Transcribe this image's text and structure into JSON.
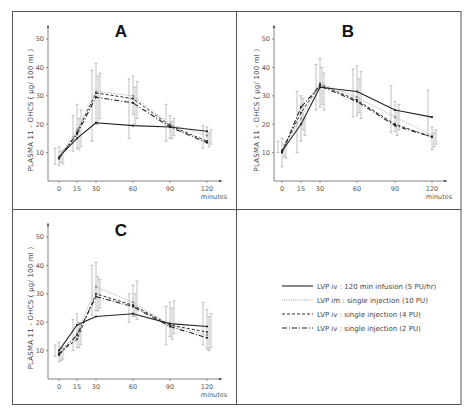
{
  "figure": {
    "legend": [
      {
        "label": "LVP iv : 120 min infusion (5 PU/hr)",
        "style": "solid"
      },
      {
        "label": "LVP im : single injection (10 PU)",
        "style": "dotted"
      },
      {
        "label": "LVP iv : single injection (4 PU)",
        "style": "dashed"
      },
      {
        "label": "LVP iv : single injection (2 PU)",
        "style": "dashdot"
      }
    ]
  },
  "chart_data": [
    {
      "type": "line",
      "title": "A",
      "xlabel": "minutes",
      "ylabel": "PLASMA 11 - OHCS ( µg/ 100 ml )",
      "x": [
        0,
        15,
        30,
        60,
        90,
        120
      ],
      "x_ticks": [
        "0",
        "15",
        "30",
        "60",
        "90",
        "120"
      ],
      "y_ticks": [
        "10",
        "20",
        "30",
        "40",
        "50"
      ],
      "ylim": [
        0,
        52
      ],
      "grid": false,
      "error_bars": true,
      "series": [
        {
          "name": "LVP iv : 120 min infusion (5 PU/hr)",
          "values": [
            8.5,
            15,
            20.5,
            19.5,
            19,
            17.5
          ]
        },
        {
          "name": "LVP im : single injection (10 PU)",
          "values": [
            8.5,
            18,
            31.5,
            30,
            20,
            16
          ]
        },
        {
          "name": "LVP iv : single injection (4 PU)",
          "values": [
            8,
            17,
            31,
            29,
            19.5,
            14
          ]
        },
        {
          "name": "LVP iv : single injection (2 PU)",
          "values": [
            8,
            16.5,
            29.5,
            27.5,
            19,
            13.5
          ]
        }
      ]
    },
    {
      "type": "line",
      "title": "B",
      "xlabel": "minutes",
      "ylabel": "PLASMA 11 - OHCS ( µg/ 100 ml )",
      "x": [
        0,
        15,
        30,
        60,
        90,
        120
      ],
      "x_ticks": [
        "0",
        "15",
        "30",
        "60",
        "90",
        "120"
      ],
      "y_ticks": [
        "10",
        "20",
        "30",
        "40",
        "50"
      ],
      "ylim": [
        0,
        52
      ],
      "grid": false,
      "error_bars": true,
      "series": [
        {
          "name": "LVP iv : 120 min infusion (5 PU/hr)",
          "values": [
            10.5,
            20,
            33,
            31.5,
            25,
            22.5
          ]
        },
        {
          "name": "LVP im : single injection (10 PU)",
          "values": [
            11,
            22,
            34.5,
            29.5,
            22.5,
            16
          ]
        },
        {
          "name": "LVP iv : single injection (4 PU)",
          "values": [
            10.5,
            24,
            34,
            28.5,
            20,
            15.5
          ]
        },
        {
          "name": "LVP iv : single injection (2 PU)",
          "values": [
            10,
            26,
            33.5,
            28,
            19.5,
            15.5
          ]
        }
      ]
    },
    {
      "type": "line",
      "title": "C",
      "xlabel": "minutes",
      "ylabel": "PLASMA 11 - OHCS ( µg/ 100 ml )",
      "x": [
        0,
        15,
        30,
        60,
        90,
        120
      ],
      "x_ticks": [
        "0",
        "15",
        "30",
        "60",
        "90",
        "120"
      ],
      "y_ticks": [
        "10",
        "20",
        "30",
        "40",
        "50"
      ],
      "ylim": [
        0,
        52
      ],
      "grid": false,
      "error_bars": true,
      "series": [
        {
          "name": "LVP iv : 120 min infusion (5 PU/hr)",
          "values": [
            10,
            19,
            22,
            23,
            19.5,
            18.5
          ]
        },
        {
          "name": "LVP im : single injection (10 PU)",
          "values": [
            9.5,
            16,
            32.5,
            27,
            19,
            15.5
          ]
        },
        {
          "name": "LVP iv : single injection (4 PU)",
          "values": [
            9,
            14,
            30,
            26,
            19,
            16.5
          ]
        },
        {
          "name": "LVP iv : single injection (2 PU)",
          "values": [
            8.5,
            15.5,
            29,
            25.5,
            18.5,
            14.5
          ]
        }
      ]
    }
  ],
  "error_bars": [
    [
      [
        [
          6,
          11.5
        ],
        [
          10.5,
          23
        ],
        [
          14,
          39
        ],
        [
          15,
          36
        ],
        [
          14,
          27
        ],
        [
          11.5,
          19.5
        ]
      ],
      [
        [
          5.5,
          12
        ],
        [
          11.5,
          27
        ],
        [
          20,
          41.5
        ],
        [
          23.5,
          37
        ],
        [
          15,
          23
        ],
        [
          13.5,
          19
        ]
      ],
      [
        [
          6,
          11
        ],
        [
          12,
          25
        ],
        [
          22,
          38
        ],
        [
          22,
          35
        ],
        [
          16,
          22
        ],
        [
          13,
          18
        ]
      ],
      [
        [
          6.5,
          10.5
        ],
        [
          11,
          22
        ],
        [
          20,
          37
        ],
        [
          20,
          33
        ],
        [
          15,
          21
        ],
        [
          12,
          17
        ]
      ]
    ],
    [
      [
        [
          10,
          14
        ],
        [
          10,
          31.5
        ],
        [
          25,
          41
        ],
        [
          22.5,
          39.5
        ],
        [
          17,
          33.5
        ],
        [
          16,
          32
        ]
      ],
      [
        [
          5,
          15
        ],
        [
          14,
          30
        ],
        [
          26,
          43
        ],
        [
          23,
          40.5
        ],
        [
          17.5,
          28
        ],
        [
          11,
          19
        ]
      ],
      [
        [
          8,
          14
        ],
        [
          16,
          22
        ],
        [
          25,
          38
        ],
        [
          22,
          38.5
        ],
        [
          18,
          27
        ],
        [
          13,
          18
        ]
      ],
      [
        [
          8.5,
          13
        ],
        [
          18,
          29
        ],
        [
          27,
          40
        ],
        [
          24,
          36
        ],
        [
          16,
          25
        ],
        [
          12,
          17
        ]
      ]
    ],
    [
      [
        [
          8,
          12
        ],
        [
          10,
          21
        ],
        [
          22.5,
          40
        ],
        [
          20,
          30
        ],
        [
          12,
          25.5
        ],
        [
          12,
          27
        ]
      ],
      [
        [
          6,
          13
        ],
        [
          11,
          23
        ],
        [
          24,
          41
        ],
        [
          22,
          33
        ],
        [
          15,
          27
        ],
        [
          10.5,
          24.5
        ]
      ],
      [
        [
          7,
          11
        ],
        [
          12,
          19
        ],
        [
          25,
          35
        ],
        [
          21,
          34.5
        ],
        [
          16,
          27.5
        ],
        [
          11,
          23
        ]
      ],
      [
        [
          6.5,
          11
        ],
        [
          11,
          20
        ],
        [
          24,
          36
        ],
        [
          22,
          30
        ],
        [
          14,
          25
        ],
        [
          10,
          22
        ]
      ]
    ]
  ]
}
